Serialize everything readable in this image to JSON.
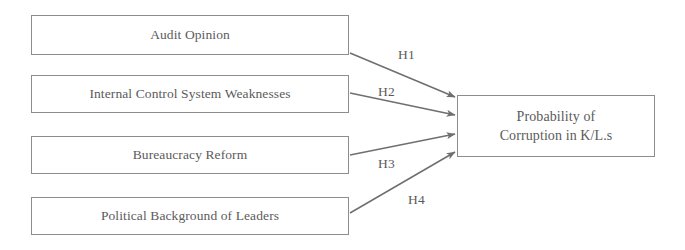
{
  "diagram": {
    "type": "path-diagram",
    "background_color": "#ffffff",
    "line_color": "#6f6f6f",
    "text_color": "#5b5b5b",
    "border_color": "#8d8d8d",
    "independent_variables": [
      {
        "id": "audit-opinion",
        "label": "Audit Opinion"
      },
      {
        "id": "internal-control-system-weaknesses",
        "label": "Internal Control System Weaknesses"
      },
      {
        "id": "bureaucracy-reform",
        "label": "Bureaucracy Reform"
      },
      {
        "id": "political-background-of-leaders",
        "label": "Political Background of Leaders"
      }
    ],
    "dependent_variable": {
      "id": "probability-of-corruption",
      "label": "Probability of\nCorruption in K/L.s"
    },
    "hypotheses": [
      {
        "id": "h1",
        "label": "H1",
        "from": "audit-opinion",
        "to": "probability-of-corruption"
      },
      {
        "id": "h2",
        "label": "H2",
        "from": "internal-control-system-weaknesses",
        "to": "probability-of-corruption"
      },
      {
        "id": "h3",
        "label": "H3",
        "from": "bureaucracy-reform",
        "to": "probability-of-corruption"
      },
      {
        "id": "h4",
        "label": "H4",
        "from": "political-background-of-leaders",
        "to": "probability-of-corruption"
      }
    ]
  }
}
